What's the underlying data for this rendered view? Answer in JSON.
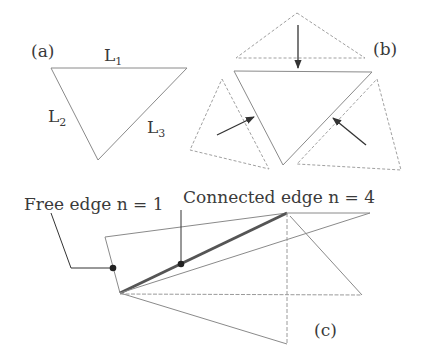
{
  "panels": {
    "a": {
      "label": "(a)",
      "edges": [
        {
          "name": "L",
          "sub": "1"
        },
        {
          "name": "L",
          "sub": "2"
        },
        {
          "name": "L",
          "sub": "3"
        }
      ]
    },
    "b": {
      "label": "(b)"
    },
    "c": {
      "label": "(c)",
      "annotations": {
        "free_edge": "Free edge n = 1",
        "connected_edge": "Connected edge n = 4"
      }
    }
  },
  "colors": {
    "line": "#8a8a8a",
    "dashed": "#9a9a9a",
    "thick": "#555555",
    "arrow": "#333333",
    "text": "#3a3a3a"
  }
}
